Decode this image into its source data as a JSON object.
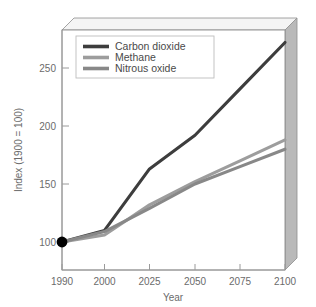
{
  "chart_data": {
    "type": "line",
    "title": "",
    "subtitle": "",
    "xlabel": "Year",
    "ylabel": "Index (1900 = 100)",
    "x": [
      1990,
      2000,
      2025,
      2050,
      2075,
      2100
    ],
    "xtick_labels": [
      "1990",
      "2000",
      "2025",
      "2050",
      "2075",
      "2100"
    ],
    "ytick_labels": [
      "100",
      "150",
      "200",
      "250"
    ],
    "ytick_values": [
      100,
      150,
      200,
      250
    ],
    "xlim": [
      1990,
      2100
    ],
    "ylim": [
      75,
      285
    ],
    "grid": false,
    "legend_position": "top-left",
    "marker_points": [
      {
        "label": "origin-marker",
        "x": 1990,
        "y": 100
      }
    ],
    "series": [
      {
        "name": "Carbon dioxide",
        "color": "#3d3d3d",
        "values": [
          100,
          110,
          163,
          192,
          232,
          272
        ]
      },
      {
        "name": "Methane",
        "color": "#9d9d9d",
        "values": [
          100,
          106,
          132,
          152,
          170,
          188
        ]
      },
      {
        "name": "Nitrous oxide",
        "color": "#888888",
        "values": [
          100,
          109,
          129,
          150,
          165,
          180
        ]
      }
    ]
  },
  "axes": {
    "x_axis_title": "Year",
    "y_axis_title": "Index (1900 = 100)",
    "x_ticks": [
      "1990",
      "2000",
      "2025",
      "2050",
      "2075",
      "2100"
    ],
    "y_ticks": [
      "250",
      "200",
      "150",
      "100"
    ]
  },
  "legend": {
    "entries": [
      {
        "label": "Carbon dioxide",
        "swatch_color": "#3d3d3d"
      },
      {
        "label": "Methane",
        "swatch_color": "#9d9d9d"
      },
      {
        "label": "Nitrous oxide",
        "swatch_color": "#888888"
      }
    ]
  },
  "style": {
    "plot_face_color": "#ffffff",
    "frame_side_color": "#b0b0b0",
    "frame_top_color": "#f0f0f0",
    "frame_line_color": "#8d8d8d",
    "axis_color": "#9a9a9a",
    "marker_color": "#000000",
    "background": "#ffffff"
  }
}
